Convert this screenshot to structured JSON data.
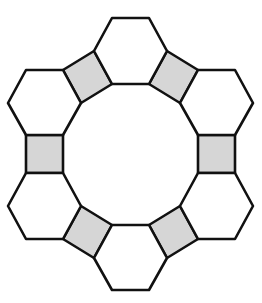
{
  "diagram": {
    "colors": {
      "stroke": "#111111",
      "hexagon_fill": "#ffffff",
      "square_fill": "#d6d6d6",
      "background": "#ffffff"
    },
    "stroke_width": 2.6,
    "hexagons": [
      {
        "id": "hex-top",
        "points": "112,18 149,18 167,51 149,84 112,84 94,51"
      },
      {
        "id": "hex-upper-left",
        "points": "26,70 63,70 81,103 63,135 26,135 8,103"
      },
      {
        "id": "hex-upper-right",
        "points": "198,70 235,70 253,103 235,135 198,135 180,103"
      },
      {
        "id": "hex-lower-left",
        "points": "26,173 63,173 81,206 63,239 26,239 8,206"
      },
      {
        "id": "hex-lower-right",
        "points": "198,173 235,173 253,206 235,239 198,239 180,206"
      },
      {
        "id": "hex-bottom",
        "points": "112,225 149,225 167,258 149,290 112,290 94,258"
      }
    ],
    "squares": [
      {
        "id": "sq-upper-left",
        "points": "63,70 94,51 112,84 81,103"
      },
      {
        "id": "sq-upper-right",
        "points": "149,84 167,51 198,70 180,103"
      },
      {
        "id": "sq-left",
        "points": "26,135 63,135 63,173 26,173"
      },
      {
        "id": "sq-right",
        "points": "198,135 235,135 235,173 198,173"
      },
      {
        "id": "sq-lower-left",
        "points": "81,206 112,225 94,258 63,239"
      },
      {
        "id": "sq-lower-right",
        "points": "180,206 198,239 167,258 149,225"
      }
    ]
  }
}
